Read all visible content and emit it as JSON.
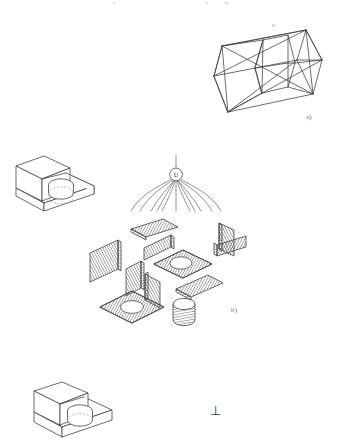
{
  "figure": {
    "kind": "engineering-diagram",
    "background_color": "#ffffff",
    "line_color": "#3c3c3c",
    "hatch_color": "#575757",
    "caption_color": "#6b6b6b"
  },
  "captions": {
    "a": "a)",
    "b": "b)"
  },
  "csg_node": {
    "operator_label": "U",
    "operator_name": "union-operator",
    "branch_count": 11
  },
  "symbols": {
    "perpendicular": "⊥"
  },
  "panels": [
    {
      "name": "wireframe-box",
      "caption": "a)",
      "description": "wireframe decomposition box with internal cell edges and face diagonals"
    },
    {
      "name": "solid-block-top",
      "description": "isometric stepped block with cylindrical boss and hidden dashed outline"
    },
    {
      "name": "boundary-rep-exploded",
      "caption": "b)",
      "description": "exploded boundary representation: hatched planar faces plus hatched cylinder"
    },
    {
      "name": "solid-block-bottom",
      "description": "isometric stepped block with cylindrical boss, cropped by page edge"
    }
  ],
  "exploded_faces": [
    {
      "name": "face-top-rear",
      "shape": "parallelogram",
      "hole": false
    },
    {
      "name": "face-left-outer",
      "shape": "parallelogram",
      "hole": false
    },
    {
      "name": "face-step-riser",
      "shape": "parallelogram",
      "hole": false
    },
    {
      "name": "face-top-with-hole",
      "shape": "parallelogram",
      "hole": true
    },
    {
      "name": "face-right-upper",
      "shape": "parallelogram",
      "hole": false
    },
    {
      "name": "face-right-lower",
      "shape": "parallelogram",
      "hole": false
    },
    {
      "name": "face-inner-left",
      "shape": "parallelogram",
      "hole": false
    },
    {
      "name": "face-inner-right",
      "shape": "parallelogram",
      "hole": false
    },
    {
      "name": "face-front-lower",
      "shape": "parallelogram",
      "hole": false
    },
    {
      "name": "face-base-with-hole",
      "shape": "parallelogram",
      "hole": true
    },
    {
      "name": "cylinder-boss",
      "shape": "cylinder",
      "hole": false
    }
  ]
}
